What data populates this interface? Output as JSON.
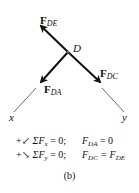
{
  "node": {
    "label": "D"
  },
  "forces": [
    {
      "id": "DE",
      "symbol": "F",
      "subscript": "DE"
    },
    {
      "id": "DC",
      "symbol": "F",
      "subscript": "DC"
    },
    {
      "id": "DA",
      "symbol": "F",
      "subscript": "DA"
    }
  ],
  "axes": {
    "x": "x",
    "y": "y"
  },
  "equations": [
    {
      "direction_arrow": "↙",
      "sum": "ΣF",
      "sum_sub": "x",
      "rhs": " = 0;",
      "result_lhs": "F",
      "result_lhs_sub": "DA",
      "result_rhs": " = 0",
      "result_rhs_sub": ""
    },
    {
      "direction_arrow": "↘",
      "sum": "ΣF",
      "sum_sub": "y",
      "rhs": " = 0;",
      "result_lhs": "F",
      "result_lhs_sub": "DC",
      "result_rhs": " = F",
      "result_rhs_sub": "DE"
    }
  ],
  "caption": "(b)"
}
